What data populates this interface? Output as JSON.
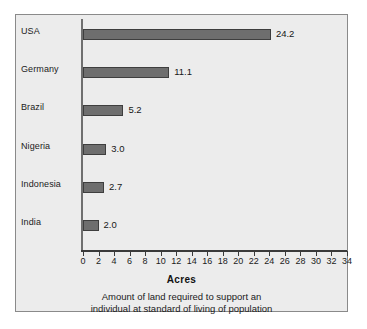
{
  "chart_data": {
    "type": "bar",
    "orientation": "horizontal",
    "title": "",
    "xlabel": "Acres",
    "ylabel": "",
    "categories": [
      "USA",
      "Germany",
      "Brazil",
      "Nigeria",
      "Indonesia",
      "India"
    ],
    "values": [
      24.2,
      11.1,
      5.2,
      3.0,
      2.7,
      2.0
    ],
    "value_labels": [
      "24.2",
      "11.1",
      "5.2",
      "3.0",
      "2.7",
      "2.0"
    ],
    "xlim": [
      0,
      34
    ],
    "xticks": [
      0,
      2,
      4,
      6,
      8,
      10,
      12,
      14,
      16,
      18,
      20,
      22,
      24,
      26,
      28,
      30,
      32,
      34
    ],
    "xtick_labels": [
      "0",
      "2",
      "4",
      "6",
      "8",
      "10",
      "12",
      "14",
      "16",
      "18",
      "20",
      "22",
      "24",
      "26",
      "28",
      "30",
      "32",
      "34"
    ],
    "grid": false,
    "legend": null,
    "bar_color": "#6e6e6e",
    "bar_edge_color": "#3e3e3e",
    "background_color": "#ececec",
    "frame_color": "#8a8a8a"
  },
  "caption": {
    "line1": "Amount of land required to support an",
    "line2": "individual at standard of living of population"
  }
}
